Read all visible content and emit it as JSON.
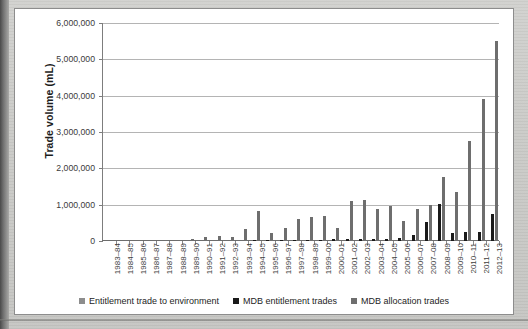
{
  "chart_data": {
    "type": "bar",
    "title": "",
    "xlabel": "",
    "ylabel": "Trade volume (mL)",
    "ylim": [
      0,
      6000000
    ],
    "ytick_labels": [
      "6,000,000",
      "5,000,000",
      "4,000,000",
      "3,000,000",
      "2,000,000",
      "1,000,000",
      "0"
    ],
    "ytick_values": [
      6000000,
      5000000,
      4000000,
      3000000,
      2000000,
      1000000,
      0
    ],
    "grid": true,
    "legend_position": "bottom",
    "categories": [
      "1983–84",
      "1984–85",
      "1985–86",
      "1986–87",
      "1987–88",
      "1988–89",
      "1989–90",
      "1990–91",
      "1991–92",
      "1992–93",
      "1993–94",
      "1994–95",
      "1995–96",
      "1996–97",
      "1997–98",
      "1998–89",
      "1999–00",
      "2000–01",
      "2001–02",
      "2002–03",
      "2003–04",
      "2004–05",
      "2005–06",
      "2006–07",
      "2007–08",
      "2008–09",
      "2009–10",
      "2010–11",
      "2011–12",
      "2012–13"
    ],
    "series": [
      {
        "name": "Entitlement trade to environment",
        "color": "#8d8d8d",
        "values": [
          0,
          0,
          0,
          0,
          0,
          0,
          0,
          0,
          0,
          0,
          0,
          0,
          0,
          0,
          0,
          0,
          0,
          0,
          0,
          0,
          0,
          0,
          0,
          0,
          0,
          0,
          0,
          0,
          0,
          0
        ]
      },
      {
        "name": "MDB entitlement trades",
        "color": "#1a1a1a",
        "values": [
          0,
          0,
          0,
          0,
          0,
          0,
          0,
          0,
          0,
          0,
          0,
          20000,
          25000,
          30000,
          30000,
          35000,
          40000,
          45000,
          55000,
          60000,
          60000,
          65000,
          70000,
          170000,
          530000,
          1010000,
          230000,
          250000,
          260000,
          740000
        ]
      },
      {
        "name": "MDB allocation trades",
        "color": "#6e6e6e",
        "values": [
          10000,
          15000,
          20000,
          25000,
          35000,
          40000,
          60000,
          120000,
          140000,
          110000,
          330000,
          830000,
          220000,
          370000,
          610000,
          660000,
          700000,
          370000,
          1100000,
          1130000,
          880000,
          960000,
          560000,
          870000,
          980000,
          1750000,
          1350000,
          2750000,
          3900000,
          5500000
        ]
      }
    ]
  },
  "legend": {
    "items": [
      {
        "label": "Entitlement trade to environment",
        "color": "#8d8d8d"
      },
      {
        "label": "MDB entitlement trades",
        "color": "#1a1a1a"
      },
      {
        "label": "MDB allocation trades",
        "color": "#6e6e6e"
      }
    ]
  }
}
